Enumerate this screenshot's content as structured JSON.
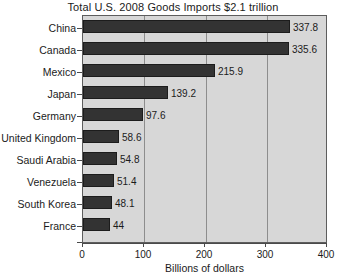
{
  "chart_data": {
    "type": "bar",
    "orientation": "horizontal",
    "title": "Total U.S. 2008 Goods Imports $2.1 trillion",
    "xlabel": "Billions of dollars",
    "ylabel": "",
    "xlim": [
      0,
      400
    ],
    "xticks": [
      "0",
      "100",
      "200",
      "300",
      "400"
    ],
    "grid": true,
    "legend": "none",
    "categories": [
      "China",
      "Canada",
      "Mexico",
      "Japan",
      "Germany",
      "United Kingdom",
      "Saudi Arabia",
      "Venezuela",
      "South Korea",
      "France"
    ],
    "values": [
      337.8,
      335.6,
      215.9,
      139.2,
      97.6,
      58.6,
      54.8,
      51.4,
      48.1,
      44
    ],
    "value_labels": [
      "337.8",
      "335.6",
      "215.9",
      "139.2",
      "97.6",
      "58.6",
      "54.8",
      "51.4",
      "48.1",
      "44"
    ],
    "colors": {
      "bar": "#333333",
      "plot_background": "#d7d7d7",
      "gridline": "#8d8d8d",
      "axis": "#4a4a4a",
      "text": "#1b1b1b",
      "page_background": "#ffffff"
    }
  }
}
